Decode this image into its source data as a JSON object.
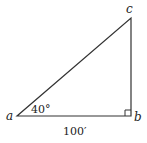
{
  "diagram": {
    "type": "right-triangle",
    "vertices": {
      "a": {
        "label": "a"
      },
      "b": {
        "label": "b"
      },
      "c": {
        "label": "c"
      }
    },
    "angle_a_label": "40°",
    "side_ab_label": "100′",
    "right_angle_at": "b",
    "colors": {
      "stroke": "#333333",
      "text": "#222222",
      "background": "#ffffff"
    }
  }
}
